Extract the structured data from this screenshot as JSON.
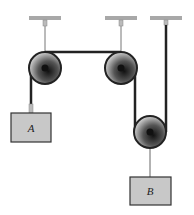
{
  "diagram": {
    "type": "pulley-system",
    "blocks": [
      {
        "label": "A",
        "x": 11,
        "y": 113,
        "w": 40,
        "h": 29
      },
      {
        "label": "B",
        "x": 130,
        "y": 177,
        "w": 41,
        "h": 28
      }
    ],
    "pulleys": [
      {
        "name": "left-fixed-pulley",
        "cx": 45,
        "cy": 68,
        "r": 16
      },
      {
        "name": "middle-fixed-pulley",
        "cx": 121,
        "cy": 68,
        "r": 16
      },
      {
        "name": "movable-pulley",
        "cx": 150,
        "cy": 132,
        "r": 16
      }
    ],
    "colors": {
      "block_fill": "#c8c8c8",
      "block_stroke": "#333333",
      "rope": "#222222",
      "ceiling": "#9a9a9a"
    }
  }
}
